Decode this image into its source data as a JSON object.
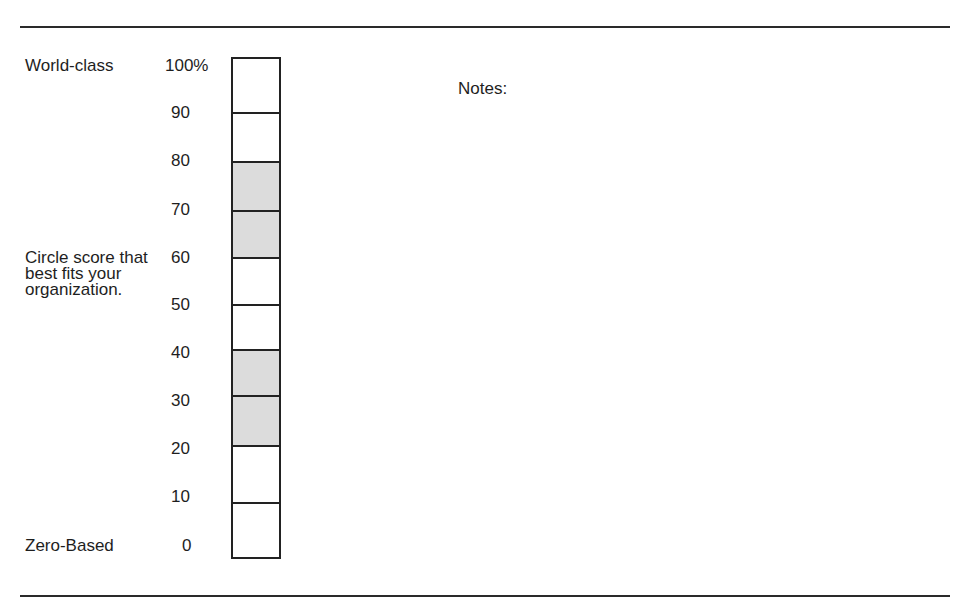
{
  "scale": {
    "top_label": "World-class",
    "bottom_label": "Zero-Based",
    "instruction": "Circle score that best fits your organization.",
    "ticks": [
      "100%",
      "90",
      "80",
      "70",
      "60",
      "50",
      "40",
      "30",
      "20",
      "10",
      "0"
    ],
    "cells": [
      {
        "range": "90-100",
        "shaded": false
      },
      {
        "range": "80-90",
        "shaded": false
      },
      {
        "range": "70-80",
        "shaded": true
      },
      {
        "range": "60-70",
        "shaded": true
      },
      {
        "range": "50-60",
        "shaded": false
      },
      {
        "range": "40-50",
        "shaded": false
      },
      {
        "range": "30-40",
        "shaded": true
      },
      {
        "range": "20-30",
        "shaded": true
      },
      {
        "range": "10-20",
        "shaded": false
      },
      {
        "range": "0-10",
        "shaded": false
      }
    ],
    "shade_color": "#dcdcdc"
  },
  "notes": {
    "label": "Notes:"
  }
}
